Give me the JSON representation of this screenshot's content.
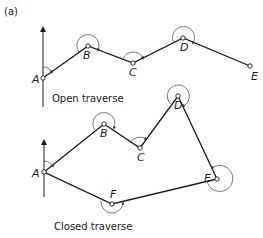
{
  "figure": {
    "part_label": "(a)",
    "colors": {
      "line": "#1a1a1a",
      "arc": "#555555",
      "background": "#ffffff"
    }
  },
  "open_traverse": {
    "caption": "Open traverse",
    "stations": [
      {
        "name": "A",
        "x": 43,
        "y": 78
      },
      {
        "name": "B",
        "x": 88,
        "y": 46
      },
      {
        "name": "C",
        "x": 133,
        "y": 63
      },
      {
        "name": "D",
        "x": 183,
        "y": 38
      },
      {
        "name": "E",
        "x": 250,
        "y": 66
      }
    ],
    "north_arrow": {
      "x": 43,
      "y_top": 27,
      "y_bottom": 107
    }
  },
  "closed_traverse": {
    "caption": "Closed traverse",
    "stations": [
      {
        "name": "A",
        "x": 44,
        "y": 172
      },
      {
        "name": "B",
        "x": 104,
        "y": 124
      },
      {
        "name": "C",
        "x": 140,
        "y": 148
      },
      {
        "name": "D",
        "x": 178,
        "y": 96
      },
      {
        "name": "E",
        "x": 217,
        "y": 179
      },
      {
        "name": "F",
        "x": 112,
        "y": 204
      }
    ],
    "north_arrow": {
      "x": 44,
      "y_top": 140,
      "y_bottom": 197
    }
  }
}
